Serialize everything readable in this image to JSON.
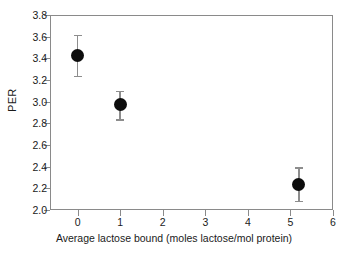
{
  "chart_data": {
    "type": "scatter",
    "title": "",
    "xlabel": "Average lactose bound (moles lactose/mol protein)",
    "ylabel": "PER",
    "xlim": [
      -0.65,
      6.0
    ],
    "ylim": [
      2.0,
      3.8
    ],
    "xticks": [
      0,
      1,
      2,
      3,
      4,
      5,
      6
    ],
    "xtick_labels": [
      "0",
      "1",
      "2",
      "3",
      "4",
      "5",
      "6"
    ],
    "yticks": [
      2.0,
      2.2,
      2.4,
      2.6,
      2.8,
      3.0,
      3.2,
      3.4,
      3.6,
      3.8
    ],
    "ytick_labels": [
      "2.0",
      "2.2",
      "2.4",
      "2.6",
      "2.8",
      "3.0",
      "3.2",
      "3.4",
      "3.6",
      "3.8"
    ],
    "grid": false,
    "legend": false,
    "error_bars": "vertical",
    "marker": "filled-circle",
    "marker_color": "#0d0d0d",
    "errorbar_color": "#8d8d8d",
    "axis_color": "#8a8a8a",
    "background_color": "#ffffff",
    "points": [
      {
        "x": 0.0,
        "y": 3.43,
        "yerr": 0.19,
        "ylow": 3.24,
        "yhigh": 3.62
      },
      {
        "x": 1.0,
        "y": 2.97,
        "yerr": 0.13,
        "ylow": 2.84,
        "yhigh": 3.1
      },
      {
        "x": 5.2,
        "y": 2.24,
        "yerr": 0.155,
        "ylow": 2.085,
        "yhigh": 2.395
      }
    ]
  }
}
